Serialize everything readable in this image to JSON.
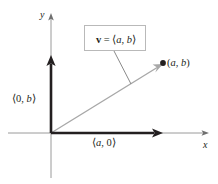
{
  "figure": {
    "type": "vector-component-diagram",
    "background_color": "#ffffff",
    "ink_color": "#231f20",
    "axis_color": "#9a9a9a",
    "vector_color": "#a8a8a8",
    "bold_component_color": "#231f20",
    "callout_border_color": "#b9b9b9"
  },
  "axes": {
    "y_label": "y",
    "x_label": "x",
    "origin_px": {
      "x": 51,
      "y": 133
    },
    "x_axis_span_px": {
      "x1": 8,
      "x2": 206,
      "y": 133
    },
    "y_axis_span_px": {
      "x": 51,
      "y1": 16,
      "y2": 178
    }
  },
  "labels": {
    "y_component": {
      "open": "⟨",
      "first": "0",
      "sep": ", ",
      "second": "b",
      "close": "⟩"
    },
    "x_component": {
      "open": "⟨",
      "first": "a",
      "sep": ", ",
      "second": "0",
      "close": "⟩"
    },
    "terminal_point": {
      "open": "(",
      "first": "a",
      "sep": ", ",
      "second": "b",
      "close": ")"
    }
  },
  "callout": {
    "vector_symbol": "v",
    "equals": " = ",
    "open": "⟨",
    "first": "a",
    "sep": ", ",
    "second": "b",
    "close": "⟩"
  },
  "geometry": {
    "vector_tip_px": {
      "x": 163,
      "y": 63
    },
    "x_component_arrow_tip_px": {
      "x": 161,
      "y": 133
    },
    "y_component_arrow_tip_px": {
      "x": 51,
      "y": 56
    },
    "point_dot_px": {
      "x": 163,
      "y": 63
    },
    "leader_line_px": {
      "x1": 115,
      "y1": 51,
      "x2": 130,
      "y2": 83
    }
  }
}
